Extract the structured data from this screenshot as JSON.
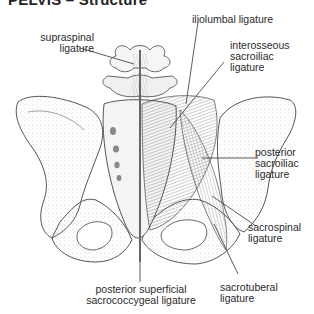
{
  "figure": {
    "title": "PELVIS",
    "title_separator": "–",
    "subtitle": "Structure",
    "view": "posterior view of pelvis",
    "colors": {
      "bone_outline": "#555555",
      "ligament": "#444444",
      "leader_line": "#333333",
      "text": "#2a2a2a"
    }
  },
  "labels": {
    "supraspinal": {
      "line1": "supraspinal",
      "line2": "ligature"
    },
    "iliolumbal": {
      "line1": "iliolumbal ligature"
    },
    "interosseous": {
      "line1": "interosseous",
      "line2": "sacroiliac",
      "line3": "ligature"
    },
    "posterior_sacroiliac": {
      "line1": "posterior",
      "line2": "sacroiliac",
      "line3": "ligature"
    },
    "sacrospinal": {
      "line1": "sacrospinal",
      "line2": "ligature"
    },
    "posterior_superficial": {
      "line1": "posterior superficial",
      "line2": "sacrococcygeal ligature"
    },
    "sacrotuberal": {
      "line1": "sacrotuberal",
      "line2": "ligature"
    }
  }
}
